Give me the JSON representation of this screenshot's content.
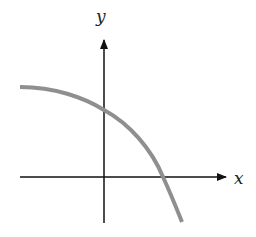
{
  "diagram": {
    "x_axis_label": "x",
    "y_axis_label": "y",
    "colors": {
      "axes": "#111111",
      "curve": "#8f8f8f",
      "background": "#ffffff"
    },
    "curve_description": "Decreasing, concave-down curve: nearly flat on the left, crossing the positive y-axis, then crossing the positive x-axis and continuing downward"
  }
}
